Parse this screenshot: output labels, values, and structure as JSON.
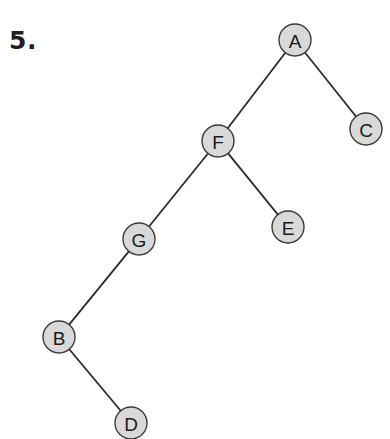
{
  "problem": {
    "number_label": "5."
  },
  "tree": {
    "node_radius": 16,
    "colors": {
      "node_fill": "#d9d9d9",
      "node_stroke": "#3a3a3a",
      "edge": "#2b2b2b",
      "label": "#1a1a1a"
    },
    "nodes": [
      {
        "id": "A",
        "label": "A",
        "x": 295,
        "y": 40
      },
      {
        "id": "C",
        "label": "C",
        "x": 366,
        "y": 129
      },
      {
        "id": "F",
        "label": "F",
        "x": 218,
        "y": 141
      },
      {
        "id": "E",
        "label": "E",
        "x": 288,
        "y": 227
      },
      {
        "id": "G",
        "label": "G",
        "x": 139,
        "y": 239
      },
      {
        "id": "B",
        "label": "B",
        "x": 59,
        "y": 337
      },
      {
        "id": "D",
        "label": "D",
        "x": 131,
        "y": 423
      }
    ],
    "edges": [
      {
        "from": "A",
        "to": "F"
      },
      {
        "from": "A",
        "to": "C"
      },
      {
        "from": "F",
        "to": "G"
      },
      {
        "from": "F",
        "to": "E"
      },
      {
        "from": "G",
        "to": "B"
      },
      {
        "from": "B",
        "to": "D"
      }
    ]
  }
}
